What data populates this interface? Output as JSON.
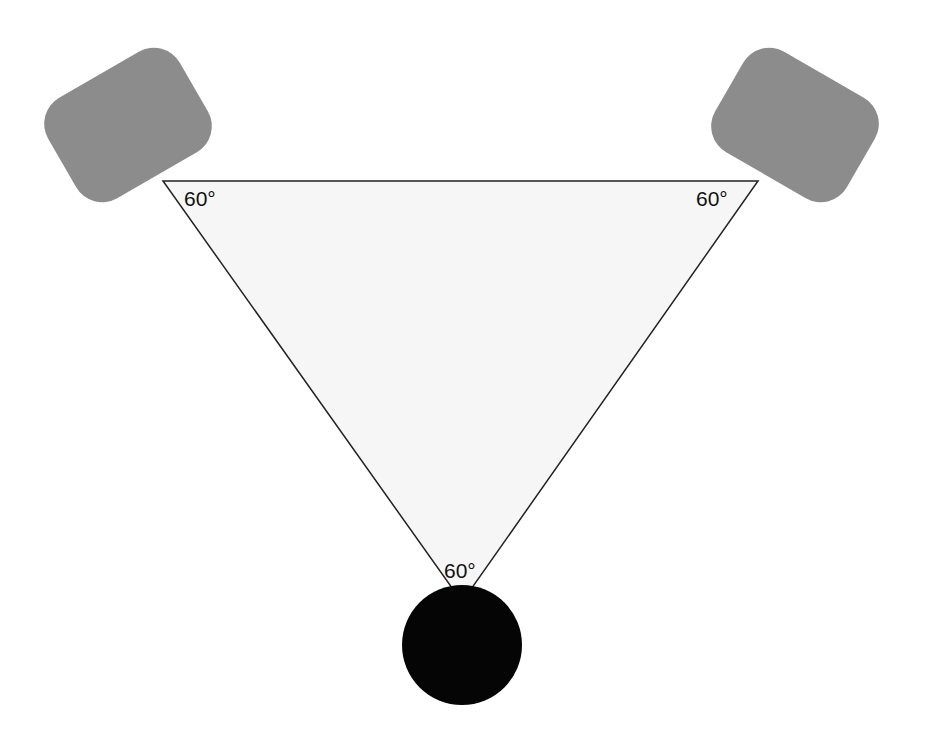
{
  "diagram": {
    "type": "stereo-triangle",
    "colors": {
      "background": "#ffffff",
      "triangle_fill": "#f6f6f6",
      "triangle_stroke": "#222222",
      "speaker_fill": "#8c8c8c",
      "listener_fill": "#050505",
      "label_color": "#111111"
    },
    "nodes": [
      {
        "id": "left-speaker",
        "shape": "rounded-rect",
        "angle_label": "60°"
      },
      {
        "id": "right-speaker",
        "shape": "rounded-rect",
        "angle_label": "60°"
      },
      {
        "id": "listener",
        "shape": "circle",
        "angle_label": "60°"
      }
    ],
    "labels": {
      "left_angle": "60°",
      "right_angle": "60°",
      "bottom_angle": "60°"
    }
  }
}
